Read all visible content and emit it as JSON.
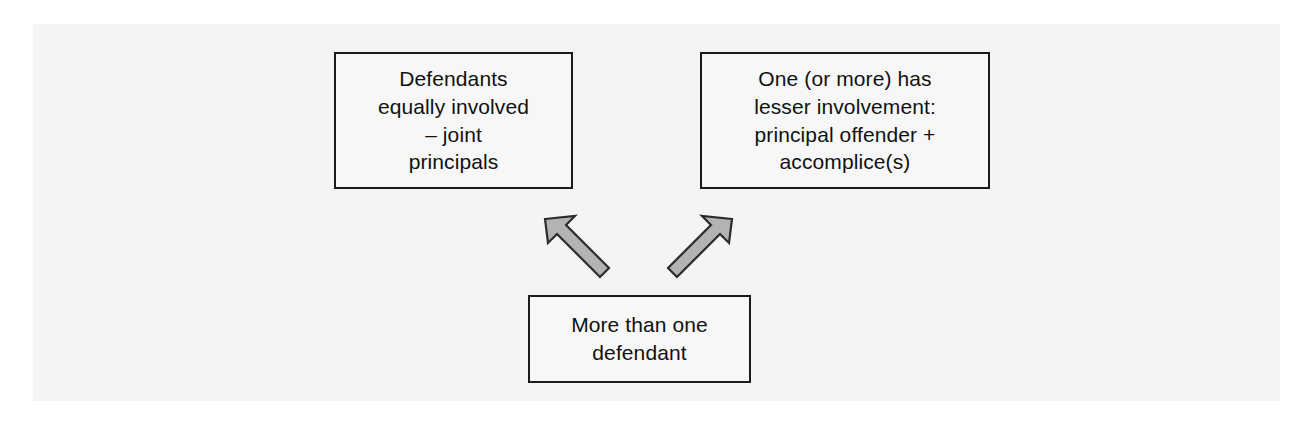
{
  "diagram": {
    "type": "flow-diagram",
    "background_color": "#f4f4f4",
    "box_fill_color": "#f7f7f7",
    "box_border_color": "#1a1a1a",
    "arrow_fill_color": "#b3b3b3",
    "arrow_border_color": "#2b2b2b",
    "text_color": "#111111",
    "nodes": [
      {
        "id": "joint-principals",
        "label": "Defendants\nequally involved\n– joint\nprincipals",
        "position": "top-left"
      },
      {
        "id": "lesser-involvement",
        "label": "One (or more) has\nlesser involvement:\nprincipal offender +\naccomplice(s)",
        "position": "top-right"
      },
      {
        "id": "more-than-one-defendant",
        "label": "More than one\ndefendant",
        "position": "bottom-centre"
      }
    ],
    "arrows": [
      {
        "id": "arrow-to-joint-principals",
        "from": "more-than-one-defendant",
        "to": "joint-principals",
        "direction": "up-left"
      },
      {
        "id": "arrow-to-lesser-involvement",
        "from": "more-than-one-defendant",
        "to": "lesser-involvement",
        "direction": "up-right"
      }
    ]
  }
}
